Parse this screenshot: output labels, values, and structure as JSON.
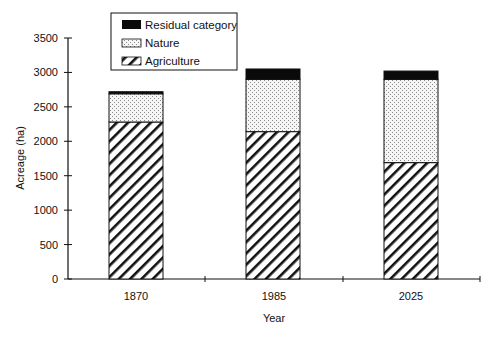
{
  "chart_data": {
    "type": "bar",
    "stacked": true,
    "title": "",
    "xlabel": "Year",
    "ylabel": "Acreage (ha)",
    "categories": [
      "1870",
      "1985",
      "2025"
    ],
    "series": [
      {
        "name": "Agriculture",
        "pattern": "diagonal-hatch",
        "values": [
          2280,
          2140,
          1690
        ]
      },
      {
        "name": "Nature",
        "pattern": "dots",
        "values": [
          410,
          760,
          1210
        ]
      },
      {
        "name": "Residual category",
        "pattern": "solid-black",
        "values": [
          30,
          150,
          120
        ]
      }
    ],
    "totals": [
      2720,
      3050,
      3020
    ],
    "ylim": [
      0,
      3500
    ],
    "yticks": [
      0,
      500,
      1000,
      1500,
      2000,
      2500,
      3000,
      3500
    ],
    "grid": false,
    "legend_position": "top-left-inside",
    "legend_order": [
      "Residual category",
      "Nature",
      "Agriculture"
    ]
  },
  "axis": {
    "ytick_labels": [
      "0",
      "500",
      "1000",
      "1500",
      "2000",
      "2500",
      "3000",
      "3500"
    ],
    "xtick_labels": [
      "1870",
      "1985",
      "2025"
    ],
    "xlabel": "Year",
    "ylabel": "Acreage (ha)"
  },
  "legend": {
    "items": [
      {
        "label": "Residual category"
      },
      {
        "label": "Nature"
      },
      {
        "label": "Agriculture"
      }
    ]
  },
  "colors": {
    "axis": "#111111",
    "residual": "#0a0a0a",
    "nature_bg": "#f4f4f4",
    "nature_dot": "#9a9a9a",
    "hatch": "#111111"
  }
}
